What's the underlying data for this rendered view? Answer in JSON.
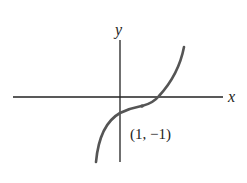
{
  "figure": {
    "type": "function-graph",
    "axes": {
      "x_label": "x",
      "y_label": "y"
    },
    "curve": {
      "description": "cubic-like increasing curve with inflection point",
      "color": "#555555"
    },
    "point": {
      "label": "(1, −1)",
      "x": 1,
      "y": -1
    },
    "colors": {
      "axes": "#222222",
      "curve": "#555555",
      "text": "#222222",
      "background": "#ffffff"
    }
  }
}
